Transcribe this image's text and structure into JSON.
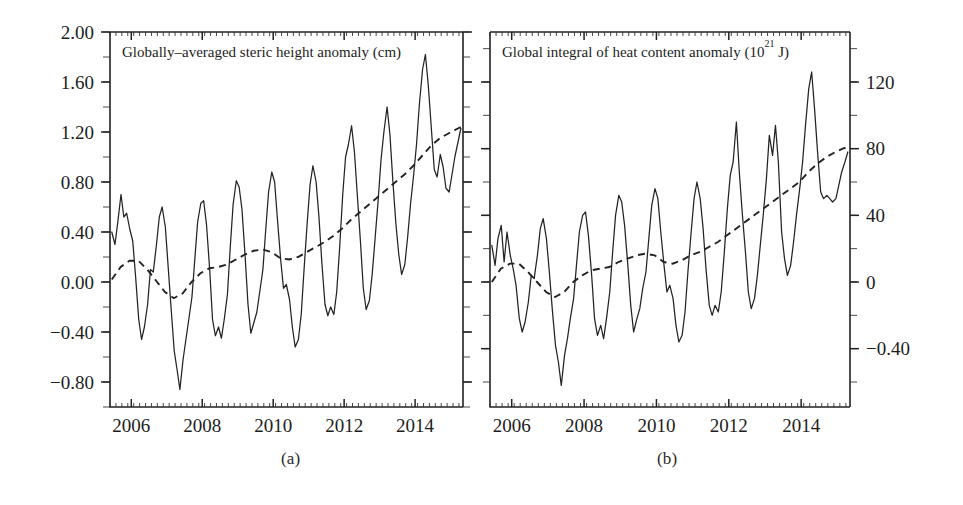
{
  "figure": {
    "width": 963,
    "height": 505,
    "background": "#ffffff",
    "line_color": "#232323"
  },
  "captions": {
    "a": "(a)",
    "b": "(b)"
  },
  "chart_data": [
    {
      "id": "panel-a",
      "type": "line",
      "title": "Globally-averaged steric height anomaly (cm)",
      "title_main": "Globally-averaged steric height anomaly (cm)",
      "caption": "(a)",
      "xlabel": "",
      "ylabel": "",
      "xlim": [
        2005.4,
        2015.35
      ],
      "ylim": [
        -1.0,
        2.0
      ],
      "grid": false,
      "legend": "none",
      "x_ticks_major": [
        2006,
        2008,
        2010,
        2012,
        2014
      ],
      "x_tick_labels": [
        "2006",
        "2008",
        "2010",
        "2012",
        "2014"
      ],
      "x_minor_interval": 0.1667,
      "y_ticks_major": [
        2.0,
        1.6,
        1.2,
        0.8,
        0.4,
        0.0,
        -0.4,
        -0.8
      ],
      "y_tick_labels": [
        "2.00",
        "1.60",
        "1.20",
        "0.80",
        "0.40",
        "0.00",
        "-0.40",
        "-0.80"
      ],
      "y_minor_interval": 0.2,
      "series": [
        {
          "name": "Monthly steric height anomaly",
          "style": "solid",
          "x": [
            2005.45,
            2005.54,
            2005.62,
            2005.71,
            2005.79,
            2005.87,
            2005.96,
            2006.04,
            2006.12,
            2006.21,
            2006.29,
            2006.37,
            2006.46,
            2006.54,
            2006.62,
            2006.71,
            2006.79,
            2006.87,
            2006.96,
            2007.04,
            2007.12,
            2007.21,
            2007.29,
            2007.37,
            2007.46,
            2007.54,
            2007.62,
            2007.71,
            2007.79,
            2007.87,
            2007.96,
            2008.04,
            2008.12,
            2008.21,
            2008.29,
            2008.37,
            2008.46,
            2008.54,
            2008.62,
            2008.71,
            2008.79,
            2008.87,
            2008.96,
            2009.04,
            2009.12,
            2009.21,
            2009.29,
            2009.37,
            2009.46,
            2009.54,
            2009.62,
            2009.71,
            2009.79,
            2009.87,
            2009.96,
            2010.04,
            2010.12,
            2010.21,
            2010.29,
            2010.37,
            2010.46,
            2010.54,
            2010.62,
            2010.71,
            2010.79,
            2010.87,
            2010.96,
            2011.04,
            2011.12,
            2011.21,
            2011.29,
            2011.37,
            2011.46,
            2011.54,
            2011.62,
            2011.71,
            2011.79,
            2011.87,
            2011.96,
            2012.04,
            2012.12,
            2012.21,
            2012.29,
            2012.37,
            2012.46,
            2012.54,
            2012.62,
            2012.71,
            2012.79,
            2012.87,
            2012.96,
            2013.04,
            2013.12,
            2013.21,
            2013.29,
            2013.37,
            2013.46,
            2013.54,
            2013.62,
            2013.71,
            2013.79,
            2013.87,
            2013.96,
            2014.04,
            2014.12,
            2014.21,
            2014.29,
            2014.37,
            2014.46,
            2014.54,
            2014.62,
            2014.71,
            2014.79,
            2014.87,
            2014.96,
            2015.04,
            2015.12,
            2015.21,
            2015.29
          ],
          "y": [
            0.4,
            0.3,
            0.48,
            0.7,
            0.52,
            0.55,
            0.42,
            0.33,
            0.05,
            -0.3,
            -0.46,
            -0.36,
            -0.18,
            0.1,
            0.08,
            0.3,
            0.52,
            0.6,
            0.44,
            0.12,
            -0.2,
            -0.55,
            -0.7,
            -0.86,
            -0.62,
            -0.46,
            -0.3,
            -0.12,
            0.18,
            0.48,
            0.63,
            0.65,
            0.46,
            0.1,
            -0.3,
            -0.43,
            -0.36,
            -0.45,
            -0.3,
            -0.1,
            0.28,
            0.62,
            0.81,
            0.76,
            0.58,
            0.2,
            -0.18,
            -0.41,
            -0.32,
            -0.24,
            -0.08,
            0.1,
            0.42,
            0.72,
            0.88,
            0.8,
            0.5,
            0.18,
            -0.05,
            -0.02,
            -0.14,
            -0.36,
            -0.52,
            -0.46,
            -0.26,
            0.1,
            0.48,
            0.78,
            0.93,
            0.8,
            0.52,
            0.16,
            -0.18,
            -0.27,
            -0.2,
            -0.26,
            -0.08,
            0.26,
            0.7,
            1.0,
            1.1,
            1.25,
            1.04,
            0.7,
            0.32,
            -0.05,
            -0.22,
            -0.15,
            0.06,
            0.34,
            0.66,
            0.98,
            1.2,
            1.4,
            1.18,
            0.82,
            0.46,
            0.22,
            0.06,
            0.14,
            0.36,
            0.62,
            0.86,
            1.1,
            1.42,
            1.7,
            1.82,
            1.58,
            1.22,
            0.9,
            0.84,
            1.02,
            0.92,
            0.75,
            0.72,
            0.86,
            1.0,
            1.12,
            1.23
          ]
        },
        {
          "name": "Smoothed trend",
          "style": "dashed",
          "x": [
            2005.45,
            2005.7,
            2005.95,
            2006.2,
            2006.45,
            2006.7,
            2006.95,
            2007.2,
            2007.45,
            2007.7,
            2007.95,
            2008.2,
            2008.45,
            2008.7,
            2008.95,
            2009.2,
            2009.45,
            2009.7,
            2009.95,
            2010.2,
            2010.45,
            2010.7,
            2010.95,
            2011.2,
            2011.45,
            2011.7,
            2011.95,
            2012.2,
            2012.45,
            2012.7,
            2012.95,
            2013.2,
            2013.45,
            2013.7,
            2013.95,
            2014.2,
            2014.45,
            2014.7,
            2014.95,
            2015.15,
            2015.29
          ],
          "y": [
            0.02,
            0.12,
            0.17,
            0.17,
            0.1,
            0.01,
            -0.08,
            -0.13,
            -0.09,
            0.0,
            0.07,
            0.11,
            0.12,
            0.14,
            0.18,
            0.22,
            0.25,
            0.26,
            0.24,
            0.19,
            0.18,
            0.2,
            0.24,
            0.28,
            0.32,
            0.37,
            0.43,
            0.5,
            0.56,
            0.62,
            0.68,
            0.74,
            0.8,
            0.86,
            0.93,
            1.01,
            1.09,
            1.15,
            1.19,
            1.22,
            1.24
          ]
        }
      ]
    },
    {
      "id": "panel-b",
      "type": "line",
      "title": "Global integral of heat content anomaly (10^21 J)",
      "title_prefix": "Global integral of heat content anomaly (10",
      "title_sup": "21",
      "title_suffix": " J)",
      "caption": "(b)",
      "xlabel": "",
      "ylabel": "",
      "xlim": [
        2005.4,
        2015.35
      ],
      "ylim": [
        -75.0,
        150.0
      ],
      "grid": false,
      "legend": "none",
      "x_ticks_major": [
        2006,
        2008,
        2010,
        2012,
        2014
      ],
      "x_tick_labels": [
        "2006",
        "2008",
        "2010",
        "2012",
        "2014"
      ],
      "x_minor_interval": 0.1667,
      "y_ticks_major": [
        120,
        80,
        40,
        0,
        -40
      ],
      "y_tick_labels": [
        "120",
        "80",
        "40",
        "0",
        "-0.40"
      ],
      "y_minor_interval": 20,
      "series": [
        {
          "name": "Monthly heat content anomaly",
          "style": "solid",
          "x": [
            2005.45,
            2005.54,
            2005.62,
            2005.71,
            2005.79,
            2005.87,
            2005.96,
            2006.04,
            2006.12,
            2006.21,
            2006.29,
            2006.37,
            2006.46,
            2006.54,
            2006.62,
            2006.71,
            2006.79,
            2006.87,
            2006.96,
            2007.04,
            2007.12,
            2007.21,
            2007.29,
            2007.37,
            2007.46,
            2007.54,
            2007.62,
            2007.71,
            2007.79,
            2007.87,
            2007.96,
            2008.04,
            2008.12,
            2008.21,
            2008.29,
            2008.37,
            2008.46,
            2008.54,
            2008.62,
            2008.71,
            2008.79,
            2008.87,
            2008.96,
            2009.04,
            2009.12,
            2009.21,
            2009.29,
            2009.37,
            2009.46,
            2009.54,
            2009.62,
            2009.71,
            2009.79,
            2009.87,
            2009.96,
            2010.04,
            2010.12,
            2010.21,
            2010.29,
            2010.37,
            2010.46,
            2010.54,
            2010.62,
            2010.71,
            2010.79,
            2010.87,
            2010.96,
            2011.04,
            2011.12,
            2011.21,
            2011.29,
            2011.37,
            2011.46,
            2011.54,
            2011.62,
            2011.71,
            2011.79,
            2011.87,
            2011.96,
            2012.04,
            2012.12,
            2012.21,
            2012.29,
            2012.37,
            2012.46,
            2012.54,
            2012.62,
            2012.71,
            2012.79,
            2012.87,
            2012.96,
            2013.04,
            2013.12,
            2013.21,
            2013.29,
            2013.37,
            2013.46,
            2013.54,
            2013.62,
            2013.71,
            2013.79,
            2013.87,
            2013.96,
            2014.04,
            2014.12,
            2014.21,
            2014.29,
            2014.37,
            2014.46,
            2014.54,
            2014.62,
            2014.71,
            2014.79,
            2014.87,
            2014.96,
            2015.04,
            2015.12,
            2015.21,
            2015.29
          ],
          "y": [
            22,
            10,
            26,
            34,
            12,
            30,
            16,
            8,
            -2,
            -22,
            -30,
            -24,
            -12,
            4,
            2,
            16,
            32,
            38,
            26,
            6,
            -16,
            -38,
            -48,
            -62,
            -44,
            -34,
            -22,
            -10,
            10,
            30,
            40,
            42,
            28,
            4,
            -22,
            -32,
            -26,
            -34,
            -22,
            -6,
            18,
            40,
            52,
            48,
            34,
            10,
            -14,
            -30,
            -22,
            -16,
            -4,
            6,
            26,
            46,
            56,
            50,
            30,
            10,
            -6,
            -2,
            -10,
            -26,
            -36,
            -32,
            -18,
            6,
            30,
            50,
            60,
            50,
            32,
            8,
            -14,
            -20,
            -14,
            -18,
            -6,
            16,
            44,
            64,
            72,
            96,
            66,
            42,
            18,
            -6,
            -16,
            -10,
            4,
            22,
            42,
            62,
            88,
            76,
            94,
            72,
            30,
            14,
            4,
            10,
            24,
            40,
            56,
            72,
            94,
            116,
            126,
            104,
            76,
            54,
            50,
            52,
            50,
            48,
            50,
            58,
            66,
            72,
            78
          ]
        },
        {
          "name": "Smoothed trend",
          "style": "dashed",
          "x": [
            2005.45,
            2005.7,
            2005.95,
            2006.2,
            2006.45,
            2006.7,
            2006.95,
            2007.2,
            2007.45,
            2007.7,
            2007.95,
            2008.2,
            2008.45,
            2008.7,
            2008.95,
            2009.2,
            2009.45,
            2009.7,
            2009.95,
            2010.2,
            2010.45,
            2010.7,
            2010.95,
            2011.2,
            2011.45,
            2011.7,
            2011.95,
            2012.2,
            2012.45,
            2012.7,
            2012.95,
            2013.2,
            2013.45,
            2013.7,
            2013.95,
            2014.2,
            2014.45,
            2014.7,
            2014.95,
            2015.15,
            2015.29
          ],
          "y": [
            0,
            8,
            11,
            11,
            6,
            0,
            -6,
            -9,
            -6,
            0,
            4,
            7,
            8,
            9,
            12,
            14,
            16,
            17,
            16,
            12,
            11,
            13,
            16,
            18,
            21,
            24,
            28,
            32,
            36,
            40,
            44,
            48,
            52,
            56,
            60,
            66,
            71,
            75,
            78,
            80,
            81
          ]
        }
      ]
    }
  ],
  "panels": {
    "a": {
      "geometry": {
        "x0": 110,
        "y0": 32,
        "x1": 463,
        "y1": 407
      },
      "title_x": 122,
      "title_y": 57
    },
    "b": {
      "geometry": {
        "x0": 490,
        "y0": 32,
        "x1": 850,
        "y1": 407
      },
      "title_x": 502,
      "title_y": 57
    }
  }
}
